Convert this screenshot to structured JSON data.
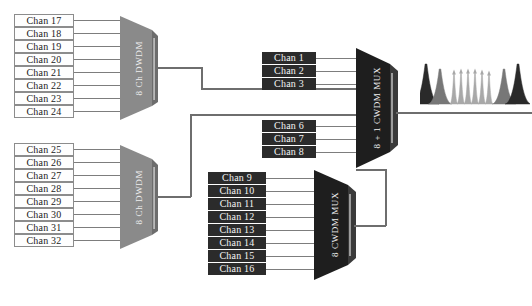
{
  "diagram": {
    "colors": {
      "light_box_fill": "#fefefe",
      "light_box_border": "#8c8c8c",
      "dark_box_fill": "#2b2b2b",
      "dark_box_text": "#f4f4f4",
      "dwdm_block_fill": "#8a8a8a",
      "dwdm_block_edge": "#6d6d6d",
      "cwdm_block_fill": "#1e1e1e",
      "cwdm_block_edge": "#3a3a3a",
      "wire": "#7d7d7d",
      "background": "#ffffff"
    },
    "groups": [
      {
        "id": "dwdm-upper",
        "block_label": "8 Ch DWDM",
        "style": "gray",
        "channels": [
          "Chan 17",
          "Chan 18",
          "Chan 19",
          "Chan 20",
          "Chan 21",
          "Chan 22",
          "Chan 23",
          "Chan 24"
        ]
      },
      {
        "id": "dwdm-lower",
        "block_label": "8 Ch DWDM",
        "style": "gray",
        "channels": [
          "Chan 25",
          "Chan 26",
          "Chan 27",
          "Chan 28",
          "Chan 29",
          "Chan 30",
          "Chan 31",
          "Chan 32"
        ]
      },
      {
        "id": "cwdm-main",
        "block_label": "8 + 1 CWDM MUX",
        "style": "black",
        "channels_top": [
          "Chan 1",
          "Chan 2",
          "Chan 3"
        ],
        "channels_bottom": [
          "Chan 6",
          "Chan 7",
          "Chan 8"
        ]
      },
      {
        "id": "cwdm-lower",
        "block_label": "8 CWDM MUX",
        "style": "black",
        "channels": [
          "Chan 9",
          "Chan 10",
          "Chan 11",
          "Chan 12",
          "Chan 13",
          "Chan 14",
          "Chan 15",
          "Chan 16"
        ]
      }
    ],
    "spectrum": {
      "name": "output-spectrum",
      "peaks": [
        {
          "x": 6,
          "height": 40,
          "width": 4.0,
          "shade": "#2a2a2a",
          "arrow": false
        },
        {
          "x": 20,
          "height": 35,
          "width": 3.6,
          "shade": "#777777",
          "arrow": false
        },
        {
          "x": 34,
          "height": 32,
          "width": 1.2,
          "shade": "#a8a8a8",
          "arrow": true
        },
        {
          "x": 41,
          "height": 33,
          "width": 1.2,
          "shade": "#a8a8a8",
          "arrow": true
        },
        {
          "x": 48,
          "height": 33,
          "width": 1.2,
          "shade": "#a8a8a8",
          "arrow": true
        },
        {
          "x": 55,
          "height": 33,
          "width": 1.2,
          "shade": "#a8a8a8",
          "arrow": true
        },
        {
          "x": 62,
          "height": 32,
          "width": 1.2,
          "shade": "#a8a8a8",
          "arrow": true
        },
        {
          "x": 69,
          "height": 31,
          "width": 1.2,
          "shade": "#a8a8a8",
          "arrow": true
        },
        {
          "x": 84,
          "height": 35,
          "width": 3.6,
          "shade": "#777777",
          "arrow": false
        },
        {
          "x": 98,
          "height": 40,
          "width": 4.0,
          "shade": "#2a2a2a",
          "arrow": false
        }
      ]
    }
  }
}
